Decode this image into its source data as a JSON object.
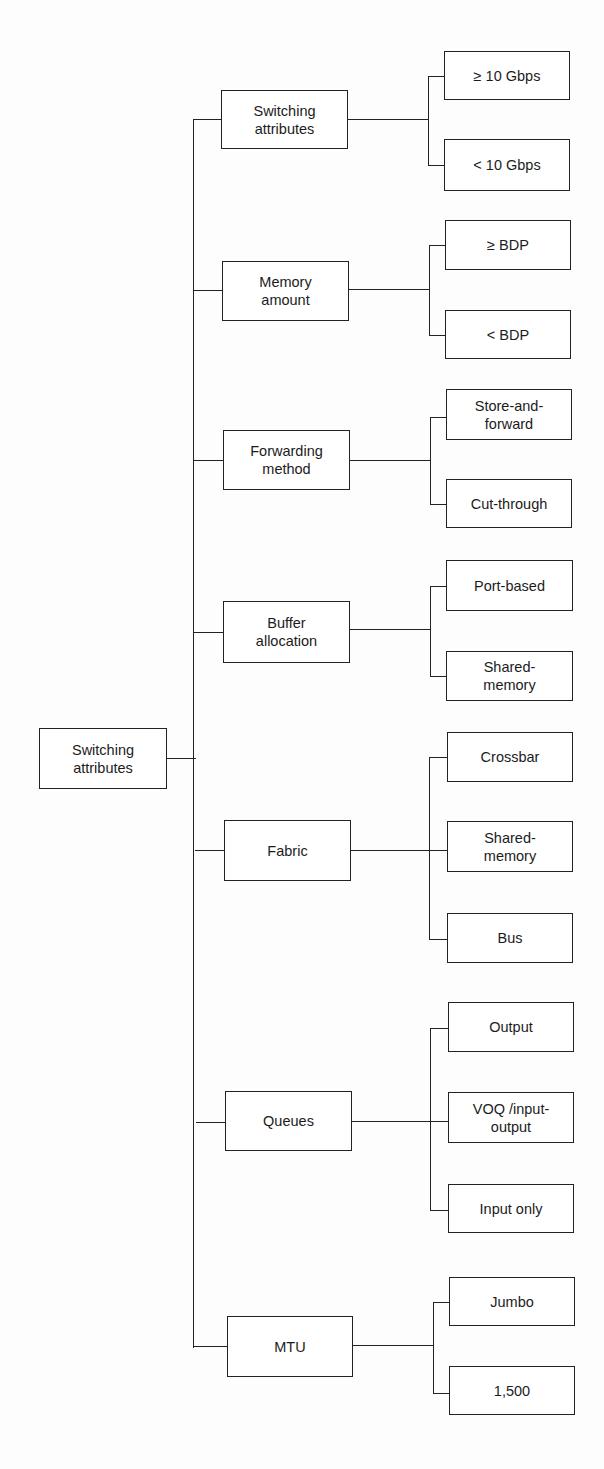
{
  "diagram": {
    "type": "tree",
    "orientation": "left-to-right",
    "root": {
      "label": "Switching\nattributes"
    },
    "branches": [
      {
        "label": "Switching\nattributes",
        "children": [
          "≥ 10 Gbps",
          "< 10 Gbps"
        ]
      },
      {
        "label": "Memory\namount",
        "children": [
          "≥ BDP",
          "< BDP"
        ]
      },
      {
        "label": "Forwarding\nmethod",
        "children": [
          "Store-and-\nforward",
          "Cut-through"
        ]
      },
      {
        "label": "Buffer\nallocation",
        "children": [
          "Port-based",
          "Shared-\nmemory"
        ]
      },
      {
        "label": "Fabric",
        "children": [
          "Crossbar",
          "Shared-\nmemory",
          "Bus"
        ]
      },
      {
        "label": "Queues",
        "children": [
          "Output",
          "VOQ /input-\noutput",
          "Input only"
        ]
      },
      {
        "label": "MTU",
        "children": [
          "Jumbo",
          "1,500"
        ]
      }
    ]
  }
}
